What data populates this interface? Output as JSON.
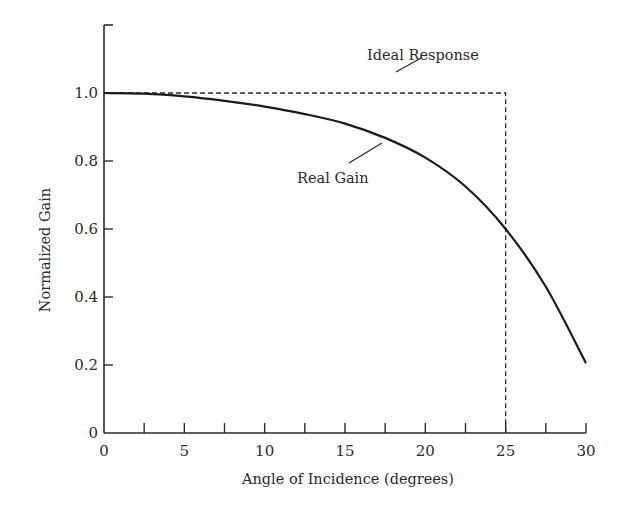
{
  "chart_data": {
    "type": "line",
    "title": "",
    "xlabel": "Angle of Incidence (degrees)",
    "ylabel": "Normalized Gain",
    "xlim": [
      0,
      30
    ],
    "ylim": [
      0,
      1.2
    ],
    "grid": false,
    "legend": null,
    "x_ticks": [
      0,
      5,
      10,
      15,
      20,
      25,
      30
    ],
    "x_tick_labels": [
      "0",
      "5",
      "10",
      "15",
      "20",
      "25",
      "30"
    ],
    "x_minor_ticks": [
      2.5,
      7.5,
      12.5,
      17.5,
      22.5,
      27.5
    ],
    "y_ticks": [
      0,
      0.2,
      0.4,
      0.6,
      0.8,
      1.0
    ],
    "y_tick_labels": [
      "0",
      "0.2",
      "0.4",
      "0.6",
      "0.8",
      "1.0"
    ],
    "series": [
      {
        "name": "Real Gain",
        "style": "solid",
        "x": [
          0,
          2.5,
          5,
          7.5,
          10,
          12.5,
          15,
          17.5,
          20,
          22.5,
          25,
          27.5,
          30
        ],
        "values": [
          1.0,
          0.998,
          0.99,
          0.977,
          0.96,
          0.938,
          0.91,
          0.868,
          0.81,
          0.725,
          0.6,
          0.43,
          0.205
        ]
      },
      {
        "name": "Ideal Response",
        "style": "dashed",
        "x": [
          0,
          25,
          25
        ],
        "values": [
          1.0,
          1.0,
          0
        ]
      }
    ],
    "annotations": [
      {
        "text": "Ideal Response",
        "points_to": {
          "x": 16.5,
          "y": 1.0
        }
      },
      {
        "text": "Real Gain",
        "points_to": {
          "x": 17.5,
          "y": 0.87
        }
      }
    ]
  },
  "labels": {
    "xlabel": "Angle of Incidence (degrees)",
    "ylabel": "Normalized Gain",
    "ideal": "Ideal Response",
    "real": "Real Gain"
  }
}
